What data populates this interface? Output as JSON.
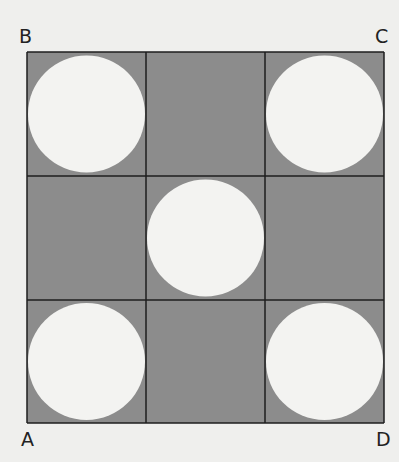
{
  "figure": {
    "rows": 3,
    "cols": 3,
    "colors": {
      "cell": "#8c8c8c",
      "circle": "#f3f3f1",
      "grid": "#1e1e1e"
    },
    "circle_cells": [
      [
        0,
        0
      ],
      [
        0,
        2
      ],
      [
        1,
        1
      ],
      [
        2,
        0
      ],
      [
        2,
        2
      ]
    ],
    "corner_labels": {
      "top_left": "B",
      "top_right": "C",
      "bottom_left": "A",
      "bottom_right": "D"
    }
  }
}
